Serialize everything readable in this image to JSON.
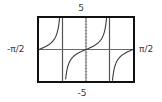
{
  "chart_data": {
    "type": "line",
    "title": "",
    "function": "y = tan(2x)",
    "xlabel": "",
    "ylabel": "",
    "xlim_labels": [
      "-π/2",
      "π/2"
    ],
    "ylim_labels": [
      "-5",
      "5"
    ],
    "xlim": [
      -1.5708,
      1.5708
    ],
    "ylim": [
      -5,
      5
    ],
    "vertical_asymptotes": [
      -0.7854,
      0.7854
    ],
    "asymptote_labels": [
      "-π/4",
      "π/4"
    ],
    "grid": false,
    "y_tick_step": 0.5,
    "series": [
      {
        "name": "tan(2x)",
        "points": [
          [
            -1.5708,
            0.0
          ],
          [
            -1.3,
            0.55
          ],
          [
            -1.1,
            1.24
          ],
          [
            -1.0,
            2.19
          ],
          [
            -0.9,
            4.29
          ],
          [
            -0.88,
            5.0
          ],
          [
            -0.69,
            -5.0
          ],
          [
            -0.6,
            -1.37
          ],
          [
            -0.4,
            -0.68
          ],
          [
            -0.2,
            -0.42
          ],
          [
            0.0,
            0.0
          ],
          [
            0.2,
            0.42
          ],
          [
            0.4,
            1.03
          ],
          [
            0.6,
            2.57
          ],
          [
            0.69,
            5.0
          ],
          [
            0.88,
            -5.0
          ],
          [
            0.9,
            -4.29
          ],
          [
            1.0,
            -2.19
          ],
          [
            1.1,
            -1.24
          ],
          [
            1.3,
            -0.55
          ],
          [
            1.5708,
            0.0
          ]
        ]
      }
    ]
  },
  "labels": {
    "top": "5",
    "bottom": "-5",
    "left": "-π/2",
    "right": "π/2"
  },
  "colors": {
    "frame": "#111111",
    "axis": "#6a6a6a",
    "curve": "#3a3a3a",
    "asymptote": "#555555"
  }
}
